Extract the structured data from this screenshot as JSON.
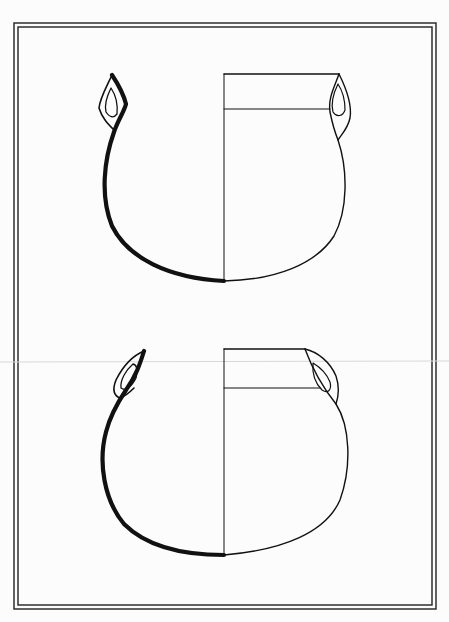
{
  "figure": {
    "type": "archaeological pottery drawing plate",
    "colors": {
      "background": "#fcfcfc",
      "ink": "#111111",
      "scan_line": "#d8d8d8"
    },
    "frame": {
      "outer": [
        14,
        23,
        436,
        609
      ],
      "inner": [
        18,
        27,
        432,
        605
      ]
    },
    "vessels": [
      {
        "name": "upper-jar",
        "description": "two-handled globular jar, section left / exterior right",
        "axis_x": 224,
        "rim_y": 74,
        "base_y": 281
      },
      {
        "name": "lower-jar",
        "description": "two-handled globular jar with everted rim, section left / exterior right",
        "axis_x": 224,
        "rim_y": 349,
        "base_y": 555
      }
    ]
  }
}
